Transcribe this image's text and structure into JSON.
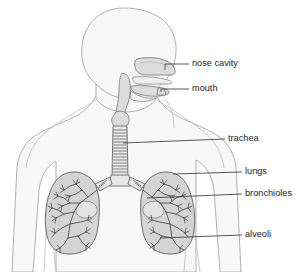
{
  "diagram": {
    "background_color": "#ffffff",
    "colors": {
      "body_fill": "#f8f8f8",
      "body_outline": "#a8a8a8",
      "lung_fill": "#d4d4d4",
      "lung_outline": "#6e6e6e",
      "airway_fill": "#dcdcdc",
      "trachea_fill": "#e8e8e8",
      "bronchial_tree": "#4a4a4a",
      "label_text": "#1d1d1d",
      "leader_line": "#3c3c3c"
    },
    "labels": [
      {
        "id": "nose-cavity",
        "text": "nose cavity",
        "text_x": 192,
        "text_y": 64,
        "leader_x1": 165,
        "leader_y1": 64,
        "leader_x2": 189,
        "leader_y2": 64,
        "pointer_x": 165,
        "pointer_y": 70
      },
      {
        "id": "mouth",
        "text": "mouth",
        "text_x": 192,
        "text_y": 89,
        "leader_x1": 161,
        "leader_y1": 89,
        "leader_x2": 189,
        "leader_y2": 89,
        "pointer_x": 161,
        "pointer_y": 92
      },
      {
        "id": "trachea",
        "text": "trachea",
        "text_x": 228,
        "text_y": 139,
        "leader_x1": 123,
        "leader_y1": 143,
        "leader_x2": 225,
        "leader_y2": 139,
        "pointer_x": 123,
        "pointer_y": 143
      },
      {
        "id": "lungs",
        "text": "lungs",
        "text_x": 245,
        "text_y": 172,
        "leader_x1": 173,
        "leader_y1": 174,
        "leader_x2": 242,
        "leader_y2": 172,
        "pointer_x": 173,
        "pointer_y": 174
      },
      {
        "id": "bronchioles",
        "text": "bronchioles",
        "text_x": 245,
        "text_y": 194,
        "leader_x1": 147,
        "leader_y1": 198,
        "leader_x2": 242,
        "leader_y2": 194,
        "pointer_x": 147,
        "pointer_y": 198
      },
      {
        "id": "alveoli",
        "text": "alveoli",
        "text_x": 245,
        "text_y": 235,
        "leader_x1": 160,
        "leader_y1": 238,
        "leader_x2": 242,
        "leader_y2": 235,
        "pointer_x": 160,
        "pointer_y": 238
      }
    ],
    "parts": [
      {
        "id": "head",
        "name": "head-profile"
      },
      {
        "id": "torso",
        "name": "torso-outline"
      },
      {
        "id": "nasal-cavity",
        "name": "nasal-cavity-shape"
      },
      {
        "id": "oral-cavity",
        "name": "oral-cavity-shape"
      },
      {
        "id": "trachea",
        "name": "trachea-tube",
        "ring_count": 15
      },
      {
        "id": "bronchus-left",
        "name": "left-main-bronchus"
      },
      {
        "id": "bronchus-right",
        "name": "right-main-bronchus"
      },
      {
        "id": "lung-left",
        "name": "left-lung"
      },
      {
        "id": "lung-right",
        "name": "right-lung"
      },
      {
        "id": "bronchial-tree-left",
        "name": "left-bronchial-tree"
      },
      {
        "id": "bronchial-tree-right",
        "name": "right-bronchial-tree"
      }
    ]
  }
}
